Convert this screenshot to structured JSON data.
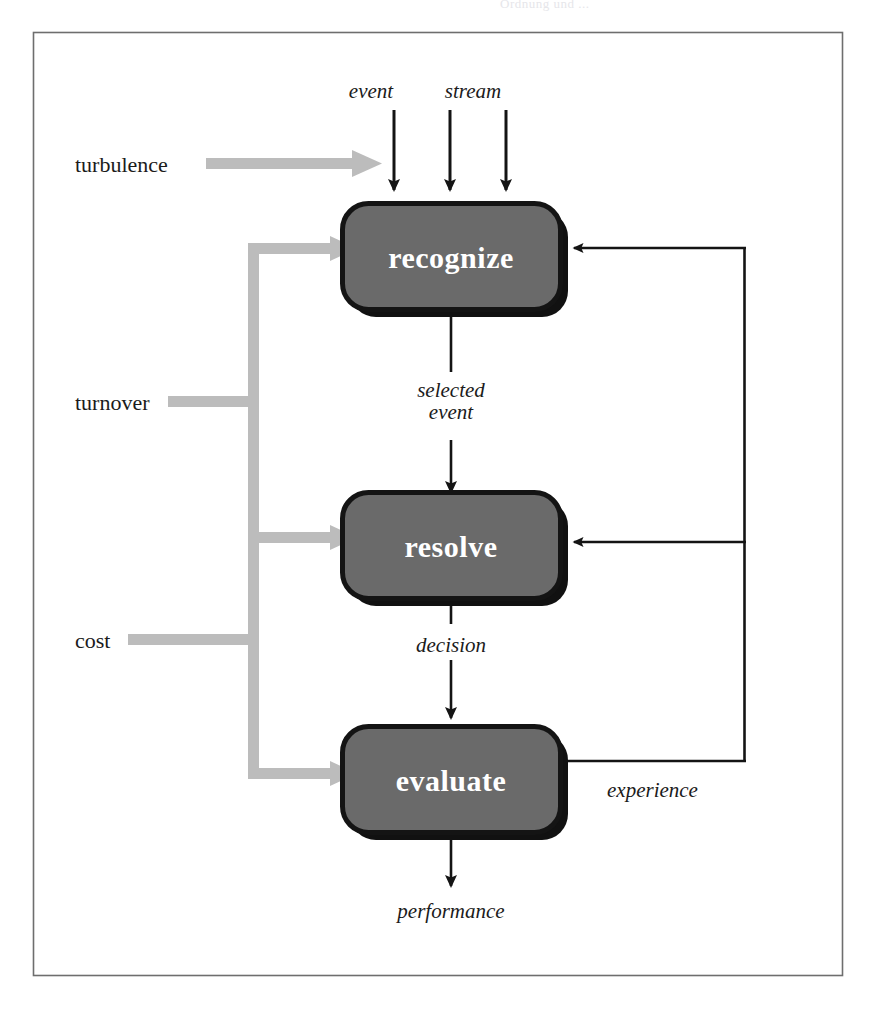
{
  "page": {
    "running_head": "Ordnung und ...",
    "background_color": "#ffffff",
    "frame_color": "#6e6e6e"
  },
  "diagram": {
    "type": "flowchart",
    "colors": {
      "box_fill": "#6a6a6a",
      "box_border": "#141414",
      "box_shadow": "#111111",
      "box_text": "#ffffff",
      "black_arrow": "#141414",
      "gray_arrow": "#bcbcbc",
      "label_text": "#1b1b1b"
    },
    "processes": [
      {
        "id": "recognize",
        "label": "recognize"
      },
      {
        "id": "resolve",
        "label": "resolve"
      },
      {
        "id": "evaluate",
        "label": "evaluate"
      }
    ],
    "inputs_top": [
      {
        "id": "event-stream-label-event",
        "label": "event"
      },
      {
        "id": "event-stream-label-stream",
        "label": "stream"
      }
    ],
    "gray_inputs": [
      {
        "id": "turbulence",
        "label": "turbulence",
        "targets": [
          "recognize"
        ]
      },
      {
        "id": "turnover",
        "label": "turnover",
        "targets": [
          "recognize",
          "resolve",
          "evaluate"
        ]
      },
      {
        "id": "cost",
        "label": "cost",
        "targets": [
          "recognize",
          "resolve",
          "evaluate"
        ]
      }
    ],
    "flow_labels": [
      {
        "id": "selected-event",
        "line1": "selected",
        "line2": "event",
        "from": "recognize",
        "to": "resolve"
      },
      {
        "id": "decision",
        "label": "decision",
        "from": "resolve",
        "to": "evaluate"
      },
      {
        "id": "performance",
        "label": "performance",
        "from": "evaluate",
        "to": "output"
      }
    ],
    "feedback": {
      "id": "experience",
      "label": "experience",
      "from": "evaluate",
      "to": [
        "recognize",
        "resolve"
      ]
    },
    "arrow_counts": {
      "event_stream_arrows": 3
    }
  }
}
